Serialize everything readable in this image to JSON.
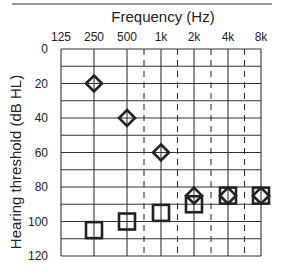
{
  "chart_data": {
    "type": "scatter",
    "title": "Frequency (Hz)",
    "xlabel": "Frequency (Hz)",
    "ylabel": "Hearing threshold (dB HL)",
    "x_tick_labels": [
      "125",
      "250",
      "500",
      "1k",
      "2k",
      "4k",
      "8k"
    ],
    "x_ticks_hz": [
      125,
      250,
      500,
      1000,
      2000,
      4000,
      8000
    ],
    "x_interoctave_dashed_hz": [
      750,
      1500,
      3000,
      6000
    ],
    "y_tick_labels": [
      "0",
      "20",
      "40",
      "60",
      "80",
      "100",
      "120"
    ],
    "ylim": [
      0,
      120
    ],
    "y_inverted": true,
    "grid": true,
    "series": [
      {
        "name": "diamond",
        "marker": "diamond",
        "x": [
          250,
          500,
          1000,
          2000,
          4000,
          8000
        ],
        "values": [
          20,
          40,
          60,
          85,
          85,
          85
        ]
      },
      {
        "name": "square",
        "marker": "square",
        "x": [
          250,
          500,
          1000,
          2000,
          4000,
          8000
        ],
        "values": [
          105,
          100,
          95,
          90,
          85,
          85
        ]
      }
    ]
  },
  "colors": {
    "ink": "#222222",
    "grid": "#333333",
    "background": "#ffffff"
  }
}
